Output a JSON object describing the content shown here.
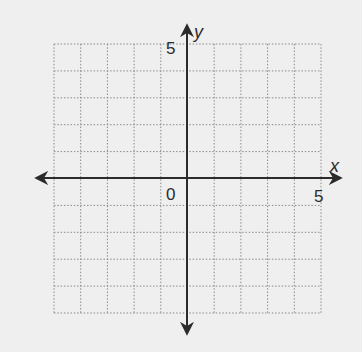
{
  "chart_data": {
    "type": "coordinate-grid",
    "title": "",
    "xlabel": "x",
    "ylabel": "y",
    "xlim": [
      -5,
      5
    ],
    "ylim": [
      -5,
      5
    ],
    "grid": true,
    "grid_style": "dotted",
    "grid_step": 1,
    "tick_labels": {
      "origin": "0",
      "x_max": "5",
      "y_max": "5"
    },
    "axes_arrows": true,
    "series": []
  },
  "labels": {
    "x_axis": "x",
    "y_axis": "y",
    "origin": "0",
    "x_tick_5": "5",
    "y_tick_5": "5"
  },
  "colors": {
    "background": "#efefef",
    "axis": "#2b2b2b",
    "grid": "#8a8a8a",
    "text": "#2b2b2b"
  }
}
